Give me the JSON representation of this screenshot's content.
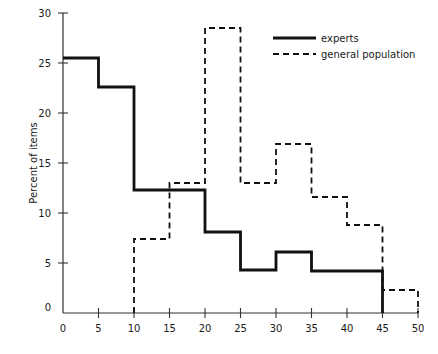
{
  "chart_data": {
    "type": "line",
    "subtype": "step-histogram",
    "title": "",
    "xlabel": "",
    "ylabel": "Percent of items",
    "xlim": [
      0,
      50
    ],
    "ylim": [
      0,
      30
    ],
    "x_ticks": [
      0,
      5,
      10,
      15,
      20,
      25,
      30,
      35,
      40,
      45,
      50
    ],
    "y_ticks": [
      0,
      5,
      10,
      15,
      20,
      25,
      30
    ],
    "grid": false,
    "legend_position": "upper right",
    "series": [
      {
        "name": "experts",
        "style": "solid",
        "bins": [
          [
            0,
            5
          ],
          [
            5,
            10
          ],
          [
            10,
            15
          ],
          [
            15,
            20
          ],
          [
            20,
            25
          ],
          [
            25,
            30
          ],
          [
            30,
            35
          ],
          [
            35,
            40
          ],
          [
            40,
            45
          ]
        ],
        "values": [
          25.5,
          22.6,
          12.3,
          12.3,
          8.1,
          4.3,
          6.1,
          4.2,
          4.2
        ]
      },
      {
        "name": "general population",
        "style": "dashed",
        "bins": [
          [
            10,
            15
          ],
          [
            15,
            20
          ],
          [
            20,
            25
          ],
          [
            25,
            30
          ],
          [
            30,
            35
          ],
          [
            35,
            40
          ],
          [
            40,
            45
          ],
          [
            45,
            50
          ]
        ],
        "values": [
          7.4,
          13.0,
          28.5,
          13.0,
          16.9,
          11.6,
          8.8,
          2.3
        ]
      }
    ]
  },
  "legend": {
    "items": [
      {
        "label": "experts",
        "style": "solid"
      },
      {
        "label": "general population",
        "style": "dashed"
      }
    ]
  },
  "axes": {
    "ylabel": "Percent of items",
    "x_tick_labels": [
      "0",
      "5",
      "10",
      "15",
      "20",
      "25",
      "30",
      "35",
      "40",
      "45",
      "50"
    ],
    "y_tick_labels": [
      "0",
      "5",
      "10",
      "15",
      "20",
      "25",
      "30"
    ]
  },
  "colors": {
    "line": "#111111",
    "axis": "#333333",
    "background": "#ffffff"
  }
}
